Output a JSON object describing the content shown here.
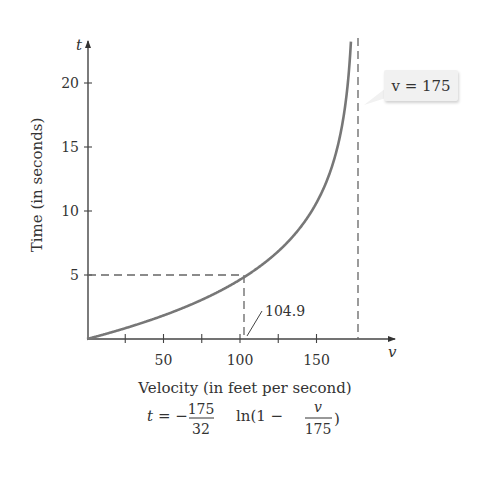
{
  "chart_data": {
    "type": "line",
    "title": "",
    "xlabel": "Velocity (in feet per second)",
    "ylabel": "Time (in seconds)",
    "x_axis_symbol": "v",
    "y_axis_symbol": "t",
    "x_ticks": [
      25,
      50,
      75,
      100,
      125,
      150
    ],
    "x_tick_labels": [
      "50",
      "100",
      "150"
    ],
    "y_ticks": [
      5,
      10,
      15,
      20
    ],
    "y_tick_labels": [
      "5",
      "10",
      "15",
      "20"
    ],
    "xlim": [
      0,
      200
    ],
    "ylim": [
      0,
      23
    ],
    "grid": false,
    "series": [
      {
        "name": "t = -(175/32) ln(1 - v/175)",
        "x": [
          0,
          25,
          50,
          75,
          100,
          104.9,
          125,
          150,
          160,
          170,
          173
        ],
        "y": [
          0,
          0.84,
          1.84,
          3.06,
          4.63,
          5.0,
          6.85,
          10.64,
          13.5,
          19.4,
          24.3
        ],
        "color": "#777777"
      }
    ],
    "annotations": [
      {
        "type": "vertical_asymptote",
        "x": 175,
        "label": "v = 175"
      },
      {
        "type": "point",
        "x": 104.9,
        "y": 5,
        "label": "104.9",
        "dashed_guides": true
      }
    ],
    "formula": {
      "lhs": "t",
      "sign": "= −",
      "coef_num": "175",
      "coef_den": "32",
      "fn": "ln(1 −",
      "frac_num": "v",
      "frac_den": "175",
      "close": ")"
    }
  }
}
